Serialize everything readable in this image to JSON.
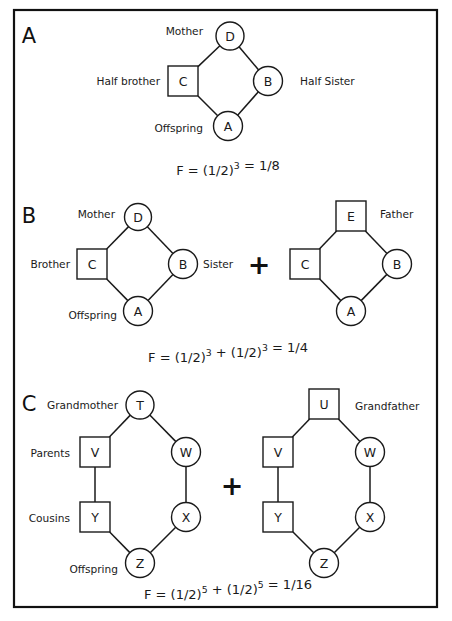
{
  "figure": {
    "border_color": "#111111",
    "background_color": "#ffffff",
    "line_color": "#1a1a1a"
  },
  "panels": [
    {
      "letter": "A",
      "diagrams": [
        {
          "nodes": [
            {
              "id": "D",
              "label": "D",
              "shape": "circle",
              "cx": 230,
              "cy": 36,
              "r": 14
            },
            {
              "id": "C",
              "label": "C",
              "shape": "square",
              "cx": 183,
              "cy": 81,
              "size": 30
            },
            {
              "id": "B",
              "label": "B",
              "shape": "circle",
              "cx": 268,
              "cy": 81,
              "r": 14.5
            },
            {
              "id": "A",
              "label": "A",
              "shape": "circle",
              "cx": 228,
              "cy": 126,
              "r": 14.5
            }
          ],
          "edges": [
            {
              "from": "D",
              "to": "C"
            },
            {
              "from": "D",
              "to": "B"
            },
            {
              "from": "C",
              "to": "A"
            },
            {
              "from": "B",
              "to": "A"
            }
          ]
        }
      ],
      "labels": [
        {
          "text": "Mother",
          "x": 203,
          "y": 31,
          "align": "end"
        },
        {
          "text": "Half  brother",
          "x": 160,
          "y": 81,
          "align": "end"
        },
        {
          "text": "Half  Sister",
          "x": 300,
          "y": 81,
          "align": "start"
        },
        {
          "text": "Offspring",
          "x": 203,
          "y": 128,
          "align": "end"
        }
      ],
      "letter_pos": {
        "x": 29,
        "y": 36
      },
      "plus": null,
      "formula": {
        "x": 228,
        "y": 170,
        "parts": [
          {
            "text": "F = (1/2)",
            "sup": false
          },
          {
            "text": "3",
            "sup": true
          },
          {
            "text": " = 1/8",
            "sup": false
          }
        ],
        "plain": "F = (1/2)3 = 1/8"
      }
    },
    {
      "letter": "B",
      "diagrams": [
        {
          "nodes": [
            {
              "id": "D",
              "label": "D",
              "shape": "circle",
              "cx": 138,
              "cy": 217,
              "r": 13.5
            },
            {
              "id": "C",
              "label": "C",
              "shape": "square",
              "cx": 92,
              "cy": 264,
              "size": 30
            },
            {
              "id": "B",
              "label": "B",
              "shape": "circle",
              "cx": 183,
              "cy": 264,
              "r": 14.5
            },
            {
              "id": "A",
              "label": "A",
              "shape": "circle",
              "cx": 138,
              "cy": 311,
              "r": 14.5
            }
          ],
          "edges": [
            {
              "from": "D",
              "to": "C"
            },
            {
              "from": "D",
              "to": "B"
            },
            {
              "from": "C",
              "to": "A"
            },
            {
              "from": "B",
              "to": "A"
            }
          ]
        },
        {
          "nodes": [
            {
              "id": "E",
              "label": "E",
              "shape": "square",
              "cx": 351,
              "cy": 216,
              "size": 30
            },
            {
              "id": "C",
              "label": "C",
              "shape": "square",
              "cx": 305,
              "cy": 264,
              "size": 30
            },
            {
              "id": "B",
              "label": "B",
              "shape": "circle",
              "cx": 397,
              "cy": 264,
              "r": 14.5
            },
            {
              "id": "A",
              "label": "A",
              "shape": "circle",
              "cx": 351,
              "cy": 311,
              "r": 14.5
            }
          ],
          "edges": [
            {
              "from": "E",
              "to": "C"
            },
            {
              "from": "E",
              "to": "B"
            },
            {
              "from": "C",
              "to": "A"
            },
            {
              "from": "B",
              "to": "A"
            }
          ]
        }
      ],
      "labels": [
        {
          "text": "Mother",
          "x": 115,
          "y": 214,
          "align": "end"
        },
        {
          "text": "Brother",
          "x": 70,
          "y": 264,
          "align": "end"
        },
        {
          "text": "Sister",
          "x": 203,
          "y": 264,
          "align": "start"
        },
        {
          "text": "Offspring",
          "x": 117,
          "y": 315,
          "align": "end"
        },
        {
          "text": "Father",
          "x": 380,
          "y": 214,
          "align": "start"
        }
      ],
      "letter_pos": {
        "x": 29,
        "y": 216
      },
      "plus": {
        "x": 259,
        "y": 264,
        "symbol": "+"
      },
      "formula": {
        "x": 228,
        "y": 357,
        "parts": [
          {
            "text": "F = (1/2)",
            "sup": false
          },
          {
            "text": "3",
            "sup": true
          },
          {
            "text": " + (1/2)",
            "sup": false
          },
          {
            "text": "3",
            "sup": true
          },
          {
            "text": " = 1/4",
            "sup": false
          }
        ],
        "plain": "F = (1/2)3 + (1/2)3 = 1/4"
      }
    },
    {
      "letter": "C",
      "diagrams": [
        {
          "nodes": [
            {
              "id": "T",
              "label": "T",
              "shape": "circle",
              "cx": 140,
              "cy": 405,
              "r": 14
            },
            {
              "id": "V",
              "label": "V",
              "shape": "square",
              "cx": 95,
              "cy": 452,
              "size": 30
            },
            {
              "id": "W",
              "label": "W",
              "shape": "circle",
              "cx": 186,
              "cy": 452,
              "r": 14.5
            },
            {
              "id": "Y",
              "label": "Y",
              "shape": "square",
              "cx": 95,
              "cy": 517,
              "size": 30
            },
            {
              "id": "X",
              "label": "X",
              "shape": "circle",
              "cx": 186,
              "cy": 517,
              "r": 14.5
            },
            {
              "id": "Z",
              "label": "Z",
              "shape": "circle",
              "cx": 140,
              "cy": 563,
              "r": 14.5
            }
          ],
          "edges": [
            {
              "from": "T",
              "to": "V"
            },
            {
              "from": "T",
              "to": "W"
            },
            {
              "from": "V",
              "to": "Y"
            },
            {
              "from": "W",
              "to": "X"
            },
            {
              "from": "Y",
              "to": "Z"
            },
            {
              "from": "X",
              "to": "Z"
            }
          ]
        },
        {
          "nodes": [
            {
              "id": "U",
              "label": "U",
              "shape": "square",
              "cx": 324,
              "cy": 404,
              "size": 30
            },
            {
              "id": "V",
              "label": "V",
              "shape": "square",
              "cx": 278,
              "cy": 452,
              "size": 30
            },
            {
              "id": "W",
              "label": "W",
              "shape": "circle",
              "cx": 370,
              "cy": 452,
              "r": 14.5
            },
            {
              "id": "Y",
              "label": "Y",
              "shape": "square",
              "cx": 278,
              "cy": 517,
              "size": 30
            },
            {
              "id": "X",
              "label": "X",
              "shape": "circle",
              "cx": 370,
              "cy": 517,
              "r": 14.5
            },
            {
              "id": "Z",
              "label": "Z",
              "shape": "circle",
              "cx": 324,
              "cy": 563,
              "r": 14.5
            }
          ],
          "edges": [
            {
              "from": "U",
              "to": "V"
            },
            {
              "from": "U",
              "to": "W"
            },
            {
              "from": "V",
              "to": "Y"
            },
            {
              "from": "W",
              "to": "X"
            },
            {
              "from": "Y",
              "to": "Z"
            },
            {
              "from": "X",
              "to": "Z"
            }
          ]
        }
      ],
      "labels": [
        {
          "text": "Grandmother",
          "x": 118,
          "y": 405,
          "align": "end"
        },
        {
          "text": "Parents",
          "x": 70,
          "y": 453,
          "align": "end"
        },
        {
          "text": "Cousins",
          "x": 70,
          "y": 518,
          "align": "end"
        },
        {
          "text": "Offspring",
          "x": 118,
          "y": 569,
          "align": "end"
        },
        {
          "text": "Grandfather",
          "x": 355,
          "y": 406,
          "align": "start"
        }
      ],
      "letter_pos": {
        "x": 29,
        "y": 404
      },
      "plus": {
        "x": 232,
        "y": 485,
        "symbol": "+"
      },
      "formula": {
        "x": 228,
        "y": 594,
        "parts": [
          {
            "text": "F = (1/2)",
            "sup": false
          },
          {
            "text": "5",
            "sup": true
          },
          {
            "text": " + (1/2)",
            "sup": false
          },
          {
            "text": "5",
            "sup": true
          },
          {
            "text": " = 1/16",
            "sup": false
          }
        ],
        "plain": "F = (1/2)5 + (1/2)5 = 1/16"
      }
    }
  ],
  "border": {
    "x": 14,
    "y": 10,
    "width": 423,
    "height": 597
  }
}
